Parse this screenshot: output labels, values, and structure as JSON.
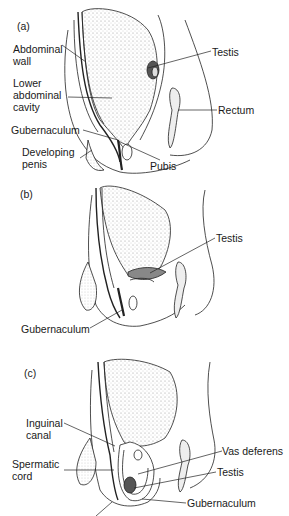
{
  "panels": [
    {
      "id": "a",
      "label": "(a)",
      "annotations": [
        {
          "text": "Abdominal\nwall"
        },
        {
          "text": "Lower\nabdominal\ncavity"
        },
        {
          "text": "Gubernaculum"
        },
        {
          "text": "Developing\npenis"
        },
        {
          "text": "Testis"
        },
        {
          "text": "Rectum"
        },
        {
          "text": "Pubis"
        }
      ]
    },
    {
      "id": "b",
      "label": "(b)",
      "annotations": [
        {
          "text": "Testis"
        },
        {
          "text": "Gubernaculum"
        }
      ]
    },
    {
      "id": "c",
      "label": "(c)",
      "annotations": [
        {
          "text": "Inguinal\ncanal"
        },
        {
          "text": "Spermatic\ncord"
        },
        {
          "text": "Vas deferens"
        },
        {
          "text": "Testis"
        },
        {
          "text": "Gubernaculum"
        }
      ]
    }
  ]
}
